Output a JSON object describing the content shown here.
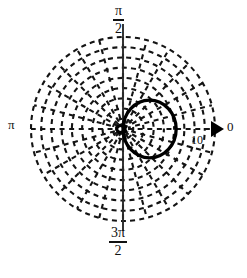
{
  "figure": {
    "axis_labels": {
      "top_numerator": "π",
      "top_denominator": "2",
      "bottom_numerator": "3π",
      "bottom_denominator": "2",
      "left": "π",
      "right": "0"
    },
    "radial_tick_label": "10",
    "colors": {
      "ink": "#000000",
      "background": "#ffffff",
      "grid": "#1a1a1a",
      "curve": "#000000"
    }
  },
  "chart_data": {
    "type": "line",
    "coordinate_system": "polar",
    "title": "",
    "xlabel": "",
    "ylabel": "",
    "theta_labels": [
      "0",
      "π/2",
      "π",
      "3π/2"
    ],
    "theta_label_positions_deg": [
      0,
      90,
      180,
      270
    ],
    "radial_ticks": [
      10
    ],
    "radial_tick_labels": [
      "10"
    ],
    "rlim": [
      0,
      18
    ],
    "grid": true,
    "grid_style": "dashed",
    "grid_rings": 9,
    "grid_spokes": 24,
    "legend": "none",
    "annotations": [
      {
        "text": "0",
        "role": "angle-axis-origin-direction",
        "marker": "right-triangle-arrow"
      },
      {
        "text": "10",
        "role": "radial-tick"
      },
      {
        "text": "π",
        "role": "angle-tick"
      },
      {
        "text": "π/2",
        "role": "angle-tick"
      },
      {
        "text": "3π/2",
        "role": "angle-tick"
      }
    ],
    "series": [
      {
        "name": "main-lobe",
        "description": "Large circular lobe tangent to the origin, centered along theta = 0",
        "shape": "circle-through-origin",
        "center_r": 5.2,
        "center_theta_deg": 0,
        "radius_r": 5.2,
        "theta": [
          0,
          15,
          30,
          45,
          60,
          75,
          90,
          105,
          120,
          135,
          150,
          165,
          180,
          195,
          210,
          225,
          240,
          255,
          270,
          285,
          300,
          315,
          330,
          345,
          360
        ],
        "r": [
          10.4,
          10.05,
          9.0,
          7.35,
          5.2,
          2.69,
          0,
          0,
          0,
          0,
          0,
          0,
          0,
          0,
          0,
          0,
          0,
          0,
          0,
          0,
          2.69,
          5.2,
          7.35,
          9.0,
          10.4
        ]
      },
      {
        "name": "back-lobe",
        "description": "Small loop at the origin extending slightly toward theta = π",
        "shape": "small-loop",
        "center_r": 0.55,
        "center_theta_deg": 180,
        "radius_r": 0.9,
        "theta": [
          0,
          45,
          90,
          135,
          180,
          225,
          270,
          315,
          360
        ],
        "r": [
          0.35,
          0.75,
          0.55,
          0.95,
          1.25,
          0.95,
          0.55,
          0.75,
          0.35
        ]
      }
    ]
  }
}
